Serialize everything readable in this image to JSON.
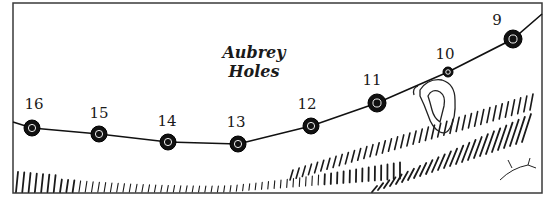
{
  "diagram": {
    "title_lines": [
      "Aubrey",
      "Holes"
    ],
    "frame": {
      "x": 13,
      "y": 3,
      "width": 529,
      "height": 190,
      "stroke": "#3a3a3a"
    },
    "line_color": "#111111",
    "holes": [
      {
        "label": "16",
        "cx": 32,
        "cy": 128,
        "r": 8,
        "lx": 34,
        "ly": 109
      },
      {
        "label": "15",
        "cx": 99,
        "cy": 134,
        "r": 8,
        "lx": 99,
        "ly": 118
      },
      {
        "label": "14",
        "cx": 168,
        "cy": 142,
        "r": 8,
        "lx": 167,
        "ly": 126
      },
      {
        "label": "13",
        "cx": 238,
        "cy": 144,
        "r": 8,
        "lx": 236,
        "ly": 127
      },
      {
        "label": "12",
        "cx": 311,
        "cy": 126,
        "r": 8,
        "lx": 307,
        "ly": 109
      },
      {
        "label": "11",
        "cx": 377,
        "cy": 103,
        "r": 9,
        "lx": 372,
        "ly": 85
      },
      {
        "label": "10",
        "cx": 448,
        "cy": 72,
        "r": 5,
        "lx": 445,
        "ly": 59
      },
      {
        "label": "9",
        "cx": 513,
        "cy": 39,
        "r": 9,
        "lx": 497,
        "ly": 25
      }
    ]
  }
}
